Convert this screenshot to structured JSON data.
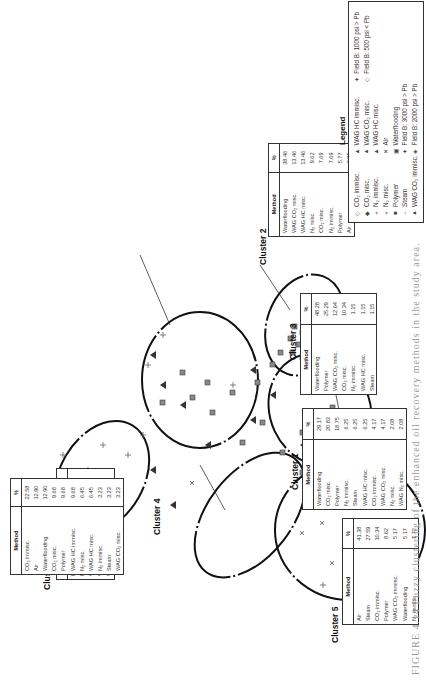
{
  "figure": {
    "caption": "FIGURE 4.14  Fuzzy clustering of the enhanced oil recovery methods in the study area."
  },
  "legend": {
    "title": "Legend",
    "items": [
      {
        "symbol": "◇",
        "label": "CO₂ immisc.",
        "icon": "open-diamond"
      },
      {
        "symbol": "◆",
        "label": "CO₂ misc.",
        "icon": "filled-diamond"
      },
      {
        "symbol": "+",
        "label": "N₂ immisc.",
        "icon": "plus"
      },
      {
        "symbol": "+",
        "label": "N₂ misc.",
        "icon": "light-plus"
      },
      {
        "symbol": "■",
        "label": "Polymer",
        "icon": "filled-square"
      },
      {
        "symbol": "−",
        "label": "Steam",
        "icon": "dash"
      },
      {
        "symbol": "▲",
        "label": "WAG CO₂ immisc.",
        "icon": "triangle"
      },
      {
        "symbol": "▲",
        "label": "WAG HC immisc.",
        "icon": "triangle"
      },
      {
        "symbol": "▲",
        "label": "WAG CO₂ misc.",
        "icon": "triangle-dark"
      },
      {
        "symbol": "▲",
        "label": "WAG HC misc.",
        "icon": "triangle-dark"
      },
      {
        "symbol": "✕",
        "label": "Air",
        "icon": "x-mark"
      },
      {
        "symbol": "▣",
        "label": "Waterflooding",
        "icon": "open-square"
      },
      {
        "symbol": "✦",
        "label": "Field B: 3000 psi > Pb",
        "icon": "star-diamond"
      },
      {
        "symbol": "◈",
        "label": "Field B: 2000 psi > Pb",
        "icon": "dot-diamond"
      },
      {
        "symbol": "✦",
        "label": "Field B: 1000 psi > Pb",
        "icon": "star-diamond"
      },
      {
        "symbol": "◇",
        "label": "Field B: 500 psi < Pb",
        "icon": "open-diamond"
      }
    ]
  },
  "clusters": [
    {
      "name": "Cluster 1",
      "header": {
        "method": "Method",
        "pct": "%"
      },
      "rows": [
        {
          "method": "Waterflooding",
          "pct": "29.17"
        },
        {
          "method": "CO₂ misc.",
          "pct": "20.83"
        },
        {
          "method": "Polymer",
          "pct": "18.75"
        },
        {
          "method": "N₂ immisc.",
          "pct": "6.25"
        },
        {
          "method": "Steam",
          "pct": "6.25"
        },
        {
          "method": "WAG HC misc.",
          "pct": "6.25"
        },
        {
          "method": "CO₂ immisc.",
          "pct": "4.17"
        },
        {
          "method": "WAG CO₂ misc.",
          "pct": "4.17"
        },
        {
          "method": "N₂ misc.",
          "pct": "2.08"
        },
        {
          "method": "WAG N₂ misc.",
          "pct": "2.08"
        }
      ]
    },
    {
      "name": "Cluster 2",
      "header": {
        "method": "Method",
        "pct": "%"
      },
      "rows": [
        {
          "method": "Waterflooding",
          "pct": "38.46"
        },
        {
          "method": "WAG CO₂ misc.",
          "pct": "13.46"
        },
        {
          "method": "WAG HC misc.",
          "pct": "13.46"
        },
        {
          "method": "N₂ misc.",
          "pct": "9.62"
        },
        {
          "method": "CO₂ misc.",
          "pct": "7.69"
        },
        {
          "method": "N₂ immisc.",
          "pct": "7.69"
        },
        {
          "method": "Polymer",
          "pct": "5.77"
        },
        {
          "method": "Air",
          "pct": "3.85"
        }
      ]
    },
    {
      "name": "Cluster 3",
      "header": {
        "method": "Method",
        "pct": "%"
      },
      "rows": [
        {
          "method": "Waterflooding",
          "pct": "48.28"
        },
        {
          "method": "Polymer",
          "pct": "25.29"
        },
        {
          "method": "WAG CO₂ misc.",
          "pct": "12.64"
        },
        {
          "method": "CO₂ misc.",
          "pct": "10.34"
        },
        {
          "method": "N₂ immisc.",
          "pct": "1.15"
        },
        {
          "method": "WAG HC misc.",
          "pct": "1.15"
        },
        {
          "method": "Steam",
          "pct": "1.15"
        }
      ]
    },
    {
      "name": "Cluster 4",
      "header": {
        "method": "Method",
        "pct": "%"
      },
      "rows": [
        {
          "method": "CO₂ immisc.",
          "pct": "22.58"
        },
        {
          "method": "Air",
          "pct": "12.90"
        },
        {
          "method": "Waterflooding",
          "pct": "12.90"
        },
        {
          "method": "CO₂ misc.",
          "pct": "9.68"
        },
        {
          "method": "Polymer",
          "pct": "9.68"
        },
        {
          "method": "WAG HC immisc.",
          "pct": "9.68"
        },
        {
          "method": "N₂ misc.",
          "pct": "6.45"
        },
        {
          "method": "WAG HC misc.",
          "pct": "6.45"
        },
        {
          "method": "N₂ immisc.",
          "pct": "3.23"
        },
        {
          "method": "Steam",
          "pct": "3.23"
        },
        {
          "method": "WAG CO₂ misc.",
          "pct": "3.23"
        }
      ]
    },
    {
      "name": "Cluster 5",
      "header": {
        "method": "Method",
        "pct": "%"
      },
      "rows": [
        {
          "method": "Air",
          "pct": "41.38"
        },
        {
          "method": "Steam",
          "pct": "27.59"
        },
        {
          "method": "CO₂ immisc.",
          "pct": "10.34"
        },
        {
          "method": "Polymer",
          "pct": "8.62"
        },
        {
          "method": "WAG CO₂ immisc.",
          "pct": "5.17"
        },
        {
          "method": "Waterflooding",
          "pct": "5.17"
        },
        {
          "method": "N₂ immisc.",
          "pct": "1.72"
        }
      ]
    },
    {
      "name": "Cluster 6",
      "header": {
        "method": "Method",
        "pct": "%"
      },
      "rows": [
        {
          "method": "N₂ misc.",
          "pct": "42.86"
        },
        {
          "method": "N₂ immisc.",
          "pct": "21.43"
        },
        {
          "method": "WAG N₂ misc.",
          "pct": "14.29"
        },
        {
          "method": "Waterflooding",
          "pct": "14.29"
        },
        {
          "method": "WAG HC misc.",
          "pct": "7.14"
        }
      ]
    }
  ]
}
